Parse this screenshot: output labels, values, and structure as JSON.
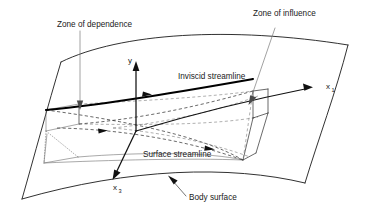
{
  "figure": {
    "background_color": "#ffffff",
    "line_color": "#1a1a1a"
  },
  "labels": {
    "zone_of_dependence": "Zone of dependence",
    "zone_of_influence": "Zone of influence",
    "inviscid_streamline": "Inviscid streamline",
    "surface_streamline": "Surface streamline",
    "body_surface": "Body surface"
  },
  "axes": {
    "y": {
      "label": "y",
      "direction": "up"
    },
    "x1": {
      "label": "x",
      "subscript": "1",
      "direction": "right"
    },
    "x3": {
      "label": "x",
      "subscript": "3",
      "direction": "down-left"
    }
  },
  "elements": {
    "body_surface_patch": "curved quadrilateral panel",
    "dependence_wedge": "left wedge volume",
    "influence_wedge": "right wedge volume",
    "streamlines": [
      "inviscid streamline (solid, thick)",
      "surface streamline (dashed)"
    ]
  }
}
